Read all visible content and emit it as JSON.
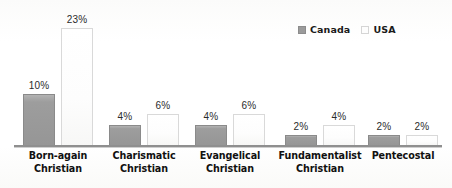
{
  "chart_data": {
    "type": "bar",
    "title": "",
    "subtitle": "",
    "xlabel": "",
    "ylabel": "",
    "ylim": [
      0,
      26
    ],
    "grid": false,
    "legend_position": "top-right",
    "value_suffix": "%",
    "categories": [
      "Born-again Christian",
      "Charismatic Christian",
      "Evangelical Christian",
      "Fundamentalist Christian",
      "Pentecostal"
    ],
    "category_lines": [
      [
        "Born-again",
        "Christian"
      ],
      [
        "Charismatic",
        "Christian"
      ],
      [
        "Evangelical",
        "Christian"
      ],
      [
        "Fundamentalist",
        "Christian"
      ],
      [
        "Pentecostal",
        ""
      ]
    ],
    "series": [
      {
        "name": "Canada",
        "color": "#9b9b9b",
        "values": [
          10,
          4,
          4,
          2,
          2
        ],
        "labels": [
          "10%",
          "4%",
          "4%",
          "2%",
          "2%"
        ]
      },
      {
        "name": "USA",
        "color": "#fdfdfd",
        "values": [
          23,
          6,
          6,
          4,
          2
        ],
        "labels": [
          "23%",
          "6%",
          "6%",
          "4%",
          "2%"
        ]
      }
    ]
  },
  "legend": {
    "entries": [
      {
        "label": "Canada",
        "swatch": "canada-swatch-icon"
      },
      {
        "label": "USA",
        "swatch": "usa-swatch-icon"
      }
    ]
  }
}
